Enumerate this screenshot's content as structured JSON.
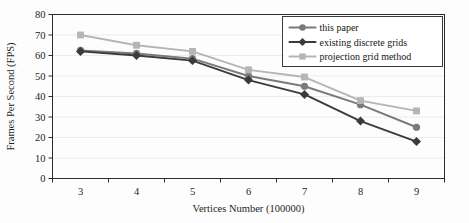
{
  "chart_data": {
    "type": "line",
    "title": "",
    "xlabel": "Vertices Number (100000)",
    "ylabel": "Frames Per Second (FPS)",
    "categories": [
      "3",
      "4",
      "5",
      "6",
      "7",
      "8",
      "9"
    ],
    "x": [
      3,
      4,
      5,
      6,
      7,
      8,
      9
    ],
    "ylim": [
      0,
      80
    ],
    "yticks": [
      "0",
      "10",
      "20",
      "30",
      "40",
      "50",
      "60",
      "70",
      "80"
    ],
    "ytick_values": [
      0,
      10,
      20,
      30,
      40,
      50,
      60,
      70,
      80
    ],
    "grid": true,
    "legend_position": "top-right-inside",
    "series": [
      {
        "name": "this paper",
        "marker": "circle",
        "color": "#7a7a7a",
        "values": [
          62.5,
          61,
          58.5,
          50,
          45,
          36,
          25
        ]
      },
      {
        "name": "existing discrete grids",
        "marker": "diamond",
        "color": "#3b3b3b",
        "values": [
          62,
          60,
          57.5,
          48,
          41,
          28,
          18
        ]
      },
      {
        "name": "projection grid method",
        "marker": "square",
        "color": "#b5b5b5",
        "values": [
          70,
          65,
          62,
          53,
          49.5,
          38,
          33
        ]
      }
    ]
  },
  "legend": {
    "entries": [
      {
        "label": "this paper"
      },
      {
        "label": "existing discrete grids"
      },
      {
        "label": "projection grid method"
      }
    ]
  },
  "axes": {
    "y_title": "Frames Per Second (FPS)",
    "x_title": "Vertices Number (100000)"
  }
}
